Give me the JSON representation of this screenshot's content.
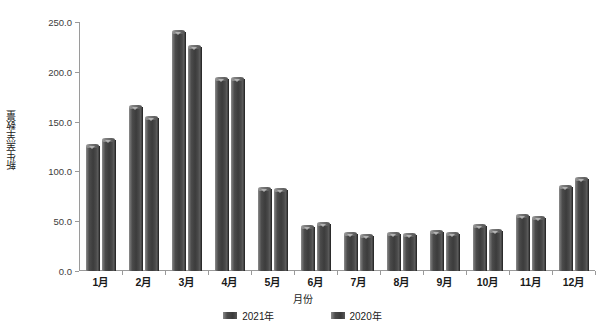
{
  "chart_data": {
    "type": "bar",
    "title": "",
    "xlabel": "月份",
    "ylabel": "新生羔羊数量",
    "categories": [
      "1月",
      "2月",
      "3月",
      "4月",
      "5月",
      "6月",
      "7月",
      "8月",
      "9月",
      "10月",
      "11月",
      "12月"
    ],
    "series": [
      {
        "name": "2021年",
        "color": "#4a4a4a",
        "values": [
          126,
          165,
          240,
          193,
          82,
          44,
          37,
          37,
          39,
          45,
          55,
          84
        ]
      },
      {
        "name": "2020年",
        "color": "#4a4a4a",
        "values": [
          132,
          154,
          225,
          193,
          81,
          47,
          35,
          36,
          37,
          40,
          53,
          92
        ]
      }
    ],
    "ylim": [
      0,
      250
    ],
    "yticks": [
      "0.0",
      "50.0",
      "100.0",
      "150.0",
      "200.0",
      "250.0"
    ],
    "ytick_values": [
      0,
      50,
      100,
      150,
      200,
      250
    ],
    "grid": false,
    "legend_position": "bottom"
  },
  "legend": {
    "items": [
      {
        "label": "2021年"
      },
      {
        "label": "2020年"
      }
    ]
  }
}
